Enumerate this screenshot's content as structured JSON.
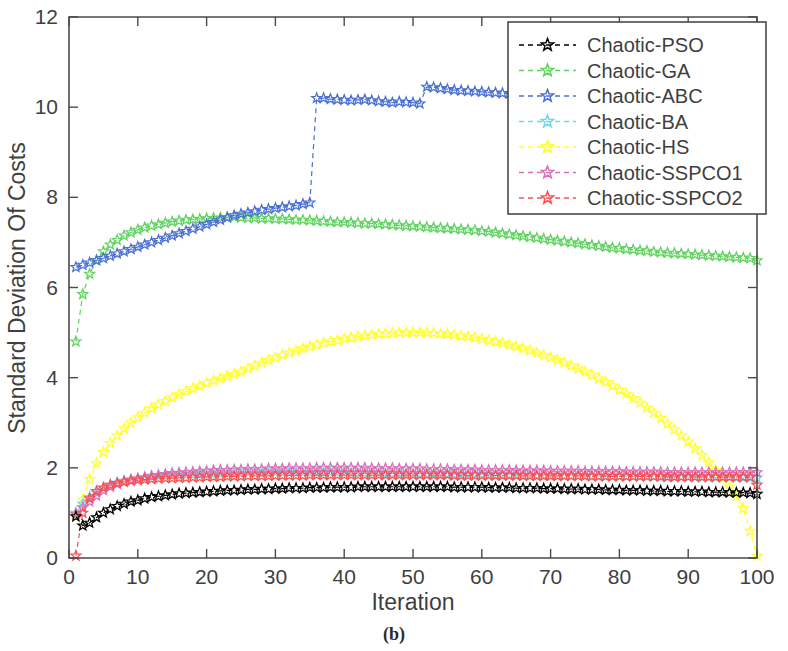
{
  "figure": {
    "caption": "(b)",
    "xlabel": "Iteration",
    "ylabel": "Standard Deviation Of Costs"
  },
  "axes": {
    "x_ticks": [
      "0",
      "10",
      "20",
      "30",
      "40",
      "50",
      "60",
      "70",
      "80",
      "90",
      "100"
    ],
    "y_ticks": [
      "0",
      "2",
      "4",
      "6",
      "8",
      "10",
      "12"
    ]
  },
  "legend": {
    "items": [
      {
        "label": "Chaotic-PSO",
        "color": "#000000",
        "marker": "star"
      },
      {
        "label": "Chaotic-GA",
        "color": "#5fd35f",
        "marker": "star"
      },
      {
        "label": "Chaotic-ABC",
        "color": "#4a6fd4",
        "marker": "star"
      },
      {
        "label": "Chaotic-BA",
        "color": "#6fd8ee",
        "marker": "star"
      },
      {
        "label": "Chaotic-HS",
        "color": "#ffff2a",
        "marker": "star"
      },
      {
        "label": "Chaotic-SSPCO1",
        "color": "#d96fb8",
        "marker": "star"
      },
      {
        "label": "Chaotic-SSPCO2",
        "color": "#ff4d4d",
        "marker": "star"
      }
    ]
  },
  "chart_data": {
    "type": "line",
    "title": "",
    "xlabel": "Iteration",
    "ylabel": "Standard Deviation Of Costs",
    "xlim": [
      0,
      100
    ],
    "ylim": [
      0,
      12
    ],
    "xtick_step": 10,
    "ytick_step": 2,
    "grid": false,
    "legend_position": "top-right",
    "marker": "five-pointed-star",
    "linestyle": "dashed",
    "x": [
      1,
      2,
      3,
      4,
      5,
      6,
      7,
      8,
      9,
      10,
      11,
      12,
      13,
      14,
      15,
      16,
      17,
      18,
      19,
      20,
      21,
      22,
      23,
      24,
      25,
      26,
      27,
      28,
      29,
      30,
      31,
      32,
      33,
      34,
      35,
      36,
      37,
      38,
      39,
      40,
      41,
      42,
      43,
      44,
      45,
      46,
      47,
      48,
      49,
      50,
      51,
      52,
      53,
      54,
      55,
      56,
      57,
      58,
      59,
      60,
      61,
      62,
      63,
      64,
      65,
      66,
      67,
      68,
      69,
      70,
      71,
      72,
      73,
      74,
      75,
      76,
      77,
      78,
      79,
      80,
      81,
      82,
      83,
      84,
      85,
      86,
      87,
      88,
      89,
      90,
      91,
      92,
      93,
      94,
      95,
      96,
      97,
      98,
      99,
      100
    ],
    "series": [
      {
        "name": "Chaotic-PSO",
        "color": "#000000",
        "values": [
          0.92,
          0.72,
          0.78,
          0.9,
          1.0,
          1.08,
          1.15,
          1.2,
          1.25,
          1.28,
          1.32,
          1.35,
          1.37,
          1.39,
          1.41,
          1.43,
          1.44,
          1.45,
          1.46,
          1.47,
          1.48,
          1.49,
          1.5,
          1.5,
          1.51,
          1.52,
          1.52,
          1.53,
          1.53,
          1.54,
          1.54,
          1.55,
          1.55,
          1.55,
          1.56,
          1.56,
          1.56,
          1.57,
          1.57,
          1.57,
          1.57,
          1.58,
          1.58,
          1.58,
          1.58,
          1.58,
          1.58,
          1.58,
          1.58,
          1.58,
          1.58,
          1.58,
          1.58,
          1.58,
          1.58,
          1.57,
          1.57,
          1.57,
          1.57,
          1.57,
          1.56,
          1.56,
          1.56,
          1.56,
          1.55,
          1.55,
          1.55,
          1.55,
          1.54,
          1.54,
          1.54,
          1.53,
          1.53,
          1.53,
          1.52,
          1.52,
          1.52,
          1.51,
          1.51,
          1.51,
          1.5,
          1.5,
          1.5,
          1.49,
          1.49,
          1.49,
          1.48,
          1.48,
          1.48,
          1.47,
          1.47,
          1.47,
          1.46,
          1.46,
          1.46,
          1.45,
          1.45,
          1.45,
          1.44,
          1.42
        ]
      },
      {
        "name": "Chaotic-GA",
        "color": "#5fd35f",
        "values": [
          4.8,
          5.85,
          6.3,
          6.6,
          6.8,
          6.95,
          7.05,
          7.15,
          7.22,
          7.28,
          7.33,
          7.37,
          7.4,
          7.43,
          7.46,
          7.48,
          7.5,
          7.51,
          7.52,
          7.53,
          7.54,
          7.55,
          7.56,
          7.56,
          7.55,
          7.54,
          7.54,
          7.53,
          7.53,
          7.52,
          7.52,
          7.51,
          7.5,
          7.5,
          7.49,
          7.48,
          7.47,
          7.46,
          7.45,
          7.45,
          7.44,
          7.43,
          7.42,
          7.42,
          7.41,
          7.4,
          7.39,
          7.38,
          7.37,
          7.36,
          7.35,
          7.34,
          7.33,
          7.32,
          7.31,
          7.3,
          7.29,
          7.28,
          7.27,
          7.25,
          7.24,
          7.22,
          7.2,
          7.18,
          7.16,
          7.14,
          7.12,
          7.1,
          7.08,
          7.06,
          7.04,
          7.02,
          7.0,
          6.98,
          6.96,
          6.94,
          6.92,
          6.9,
          6.88,
          6.87,
          6.85,
          6.84,
          6.82,
          6.81,
          6.79,
          6.78,
          6.77,
          6.76,
          6.75,
          6.74,
          6.73,
          6.72,
          6.71,
          6.7,
          6.69,
          6.68,
          6.67,
          6.66,
          6.65,
          6.6
        ]
      },
      {
        "name": "Chaotic-ABC",
        "color": "#4a6fd4",
        "values": [
          6.45,
          6.5,
          6.55,
          6.6,
          6.65,
          6.7,
          6.75,
          6.8,
          6.85,
          6.9,
          6.95,
          7.0,
          7.05,
          7.1,
          7.15,
          7.2,
          7.25,
          7.3,
          7.35,
          7.4,
          7.45,
          7.5,
          7.55,
          7.6,
          7.63,
          7.66,
          7.69,
          7.72,
          7.74,
          7.76,
          7.78,
          7.8,
          7.82,
          7.85,
          7.88,
          10.2,
          10.2,
          10.18,
          10.17,
          10.16,
          10.15,
          10.16,
          10.17,
          10.15,
          10.13,
          10.12,
          10.1,
          10.12,
          10.11,
          10.1,
          10.08,
          10.45,
          10.44,
          10.42,
          10.4,
          10.38,
          10.37,
          10.36,
          10.35,
          10.34,
          10.33,
          10.32,
          10.31,
          10.3,
          10.3,
          10.29,
          10.28,
          10.28,
          10.27,
          10.26,
          10.26,
          10.25,
          10.25,
          10.24,
          10.24,
          10.23,
          10.23,
          10.22,
          10.22,
          10.21,
          10.21,
          10.2,
          10.2,
          10.2,
          10.19,
          10.19,
          10.18,
          10.18,
          10.18,
          10.17,
          10.17,
          10.16,
          10.16,
          10.15,
          10.15,
          10.14,
          10.14,
          10.13,
          10.12,
          8.6
        ]
      },
      {
        "name": "Chaotic-BA",
        "color": "#6fd8ee",
        "values": [
          1.0,
          1.2,
          1.35,
          1.45,
          1.55,
          1.62,
          1.67,
          1.71,
          1.74,
          1.76,
          1.78,
          1.8,
          1.81,
          1.82,
          1.83,
          1.84,
          1.85,
          1.85,
          1.86,
          1.86,
          1.87,
          1.87,
          1.88,
          1.88,
          1.88,
          1.89,
          1.89,
          1.89,
          1.89,
          1.9,
          1.9,
          1.9,
          1.9,
          1.9,
          1.9,
          1.9,
          1.9,
          1.9,
          1.9,
          1.9,
          1.89,
          1.89,
          1.89,
          1.89,
          1.89,
          1.88,
          1.88,
          1.88,
          1.88,
          1.88,
          1.87,
          1.87,
          1.87,
          1.87,
          1.87,
          1.86,
          1.86,
          1.86,
          1.86,
          1.86,
          1.85,
          1.85,
          1.85,
          1.85,
          1.85,
          1.84,
          1.84,
          1.84,
          1.84,
          1.84,
          1.83,
          1.83,
          1.83,
          1.83,
          1.83,
          1.82,
          1.82,
          1.82,
          1.82,
          1.82,
          1.81,
          1.81,
          1.81,
          1.81,
          1.81,
          1.8,
          1.8,
          1.8,
          1.8,
          1.8,
          1.8,
          1.79,
          1.79,
          1.79,
          1.79,
          1.79,
          1.78,
          1.78,
          1.78,
          1.78
        ]
      },
      {
        "name": "Chaotic-HS",
        "color": "#ffff2a",
        "values": [
          0.95,
          1.3,
          1.75,
          2.1,
          2.35,
          2.55,
          2.72,
          2.87,
          3.0,
          3.12,
          3.22,
          3.32,
          3.4,
          3.48,
          3.56,
          3.63,
          3.7,
          3.76,
          3.82,
          3.88,
          3.93,
          3.98,
          4.03,
          4.08,
          4.13,
          4.2,
          4.27,
          4.33,
          4.39,
          4.45,
          4.5,
          4.55,
          4.6,
          4.65,
          4.69,
          4.73,
          4.77,
          4.8,
          4.83,
          4.86,
          4.89,
          4.91,
          4.93,
          4.95,
          4.97,
          4.98,
          4.99,
          5.0,
          5.0,
          5.0,
          5.0,
          5.0,
          4.99,
          4.98,
          4.97,
          4.95,
          4.93,
          4.91,
          4.89,
          4.86,
          4.83,
          4.8,
          4.77,
          4.73,
          4.69,
          4.65,
          4.6,
          4.55,
          4.5,
          4.45,
          4.39,
          4.33,
          4.27,
          4.2,
          4.13,
          4.06,
          3.98,
          3.9,
          3.82,
          3.73,
          3.64,
          3.54,
          3.44,
          3.33,
          3.22,
          3.1,
          2.98,
          2.85,
          2.72,
          2.58,
          2.43,
          2.28,
          2.12,
          1.95,
          1.77,
          1.58,
          1.37,
          1.1,
          0.6,
          0.05
        ]
      },
      {
        "name": "Chaotic-SSPCO1",
        "color": "#d96fb8",
        "values": [
          0.98,
          1.12,
          1.25,
          1.38,
          1.5,
          1.58,
          1.64,
          1.69,
          1.73,
          1.76,
          1.79,
          1.82,
          1.84,
          1.86,
          1.88,
          1.89,
          1.9,
          1.91,
          1.92,
          1.93,
          1.94,
          1.95,
          1.95,
          1.96,
          1.96,
          1.97,
          1.97,
          1.97,
          1.98,
          1.98,
          1.98,
          1.99,
          1.99,
          1.99,
          1.99,
          2.0,
          2.0,
          2.0,
          2.0,
          2.0,
          2.0,
          2.0,
          2.0,
          1.99,
          1.99,
          1.99,
          1.99,
          1.98,
          1.98,
          1.98,
          1.98,
          1.97,
          1.97,
          1.97,
          1.97,
          1.96,
          1.96,
          1.96,
          1.96,
          1.95,
          1.95,
          1.95,
          1.95,
          1.95,
          1.94,
          1.94,
          1.94,
          1.94,
          1.94,
          1.93,
          1.93,
          1.93,
          1.93,
          1.93,
          1.92,
          1.92,
          1.92,
          1.92,
          1.92,
          1.92,
          1.91,
          1.91,
          1.91,
          1.91,
          1.91,
          1.91,
          1.9,
          1.9,
          1.9,
          1.9,
          1.9,
          1.9,
          1.9,
          1.9,
          1.9,
          1.9,
          1.9,
          1.9,
          1.9,
          1.9
        ]
      },
      {
        "name": "Chaotic-SSPCO2",
        "color": "#ff4d4d",
        "values": [
          0.05,
          1.0,
          1.32,
          1.48,
          1.56,
          1.62,
          1.66,
          1.69,
          1.71,
          1.73,
          1.74,
          1.75,
          1.76,
          1.77,
          1.77,
          1.78,
          1.78,
          1.79,
          1.79,
          1.8,
          1.8,
          1.8,
          1.81,
          1.81,
          1.81,
          1.82,
          1.82,
          1.82,
          1.82,
          1.83,
          1.83,
          1.83,
          1.83,
          1.83,
          1.84,
          1.84,
          1.84,
          1.84,
          1.84,
          1.84,
          1.84,
          1.84,
          1.84,
          1.84,
          1.84,
          1.84,
          1.84,
          1.84,
          1.84,
          1.84,
          1.84,
          1.84,
          1.84,
          1.84,
          1.84,
          1.83,
          1.83,
          1.83,
          1.83,
          1.83,
          1.83,
          1.83,
          1.83,
          1.83,
          1.83,
          1.82,
          1.82,
          1.82,
          1.82,
          1.82,
          1.82,
          1.82,
          1.82,
          1.82,
          1.82,
          1.81,
          1.81,
          1.81,
          1.81,
          1.81,
          1.81,
          1.81,
          1.81,
          1.81,
          1.81,
          1.81,
          1.8,
          1.8,
          1.8,
          1.8,
          1.8,
          1.8,
          1.8,
          1.8,
          1.8,
          1.8,
          1.8,
          1.8,
          1.8,
          1.62
        ]
      }
    ]
  }
}
